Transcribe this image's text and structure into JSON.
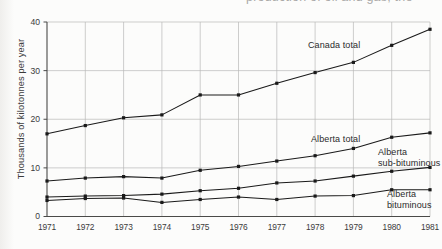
{
  "page": {
    "cropped_body_text": "production of oil and gas; the"
  },
  "chart_data": {
    "type": "line",
    "title": "",
    "xlabel": "",
    "ylabel": "Thousands of kilotonnes per year",
    "x": [
      1971,
      1972,
      1973,
      1974,
      1975,
      1976,
      1977,
      1978,
      1979,
      1980,
      1981
    ],
    "xtick_labels": [
      "1971",
      "1972",
      "1973",
      "1974",
      "1975",
      "1976",
      "1977",
      "1978",
      "1979",
      "1980",
      "1981"
    ],
    "ytick_labels": [
      "0",
      "10",
      "20",
      "30",
      "40"
    ],
    "yticks": [
      0,
      10,
      20,
      30,
      40
    ],
    "ylim": [
      0,
      40
    ],
    "xlim": [
      1971,
      1981
    ],
    "grid": "both",
    "legend": "inline-annotations",
    "series": [
      {
        "name": "Canada total",
        "label": "Canada total",
        "label_line1": "Canada total",
        "label_line2": "",
        "values": [
          17.0,
          18.7,
          20.3,
          20.9,
          25.0,
          25.0,
          27.4,
          29.6,
          31.7,
          35.2,
          38.5
        ]
      },
      {
        "name": "Alberta total",
        "label": "Alberta total",
        "label_line1": "Alberta total",
        "label_line2": "",
        "values": [
          7.3,
          7.9,
          8.2,
          7.9,
          9.5,
          10.3,
          11.4,
          12.5,
          14.0,
          16.3,
          17.2
        ]
      },
      {
        "name": "Alberta sub-bituminous",
        "label": "Alberta sub-bituminous",
        "label_line1": "Alberta",
        "label_line2": "sub-bituminous",
        "values": [
          4.0,
          4.2,
          4.3,
          4.6,
          5.3,
          5.8,
          6.9,
          7.3,
          8.3,
          9.3,
          10.1
        ]
      },
      {
        "name": "Alberta bituminous",
        "label": "Alberta bituminous",
        "label_line1": "Alberta",
        "label_line2": "bituminous",
        "values": [
          3.3,
          3.7,
          3.8,
          2.9,
          3.5,
          4.0,
          3.5,
          4.2,
          4.3,
          5.5,
          5.5
        ]
      }
    ],
    "colors": {
      "line": "#1a1a1a",
      "grid": "#b9b9b7",
      "axis": "#4a4a48",
      "text": "#2b2b2b"
    }
  }
}
